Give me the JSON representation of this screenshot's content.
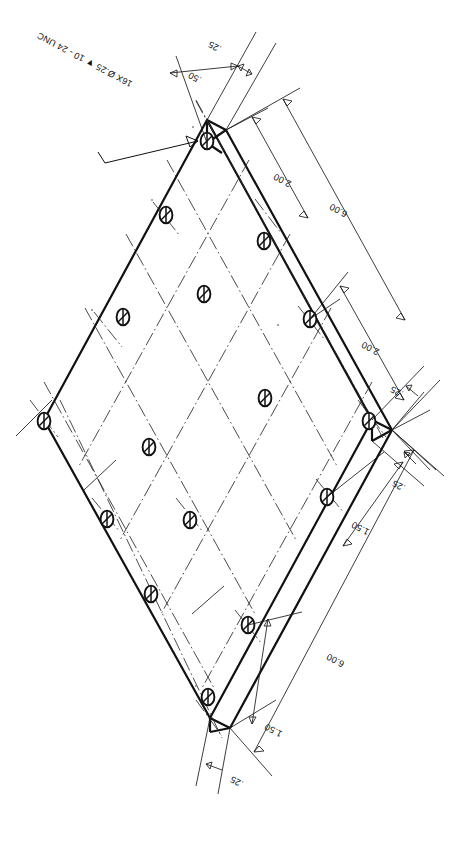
{
  "drawing": {
    "title": "Square plate — rotated plan view with tapped hole pattern",
    "view_rotation_deg": 180,
    "background_color": "#ffffff",
    "line_color": "#111111",
    "paper_size_px": [
      462,
      844
    ]
  },
  "note": {
    "id": "hole-callout",
    "text": "16X Ø.25 ▼ 10 - 24 UNC",
    "quantity_label": "16X",
    "diameter_label": "Ø.25",
    "depth_symbol": "▼",
    "thread_label": "10 - 24 UNC"
  },
  "dimensions": [
    {
      "id": "dim-top-025",
      "label": ".25",
      "value": 0.25,
      "units": "in",
      "location": "top-left-edge-offset"
    },
    {
      "id": "dim-top-050",
      "label": ".50",
      "value": 0.5,
      "units": "in",
      "location": "top-left-edge-offset"
    },
    {
      "id": "dim-upper-right-200",
      "label": "2.00",
      "value": 2.0,
      "units": "in",
      "location": "upper-right-pitch"
    },
    {
      "id": "dim-upper-right-600",
      "label": "6.00",
      "value": 6.0,
      "units": "in",
      "location": "upper-right-overall"
    },
    {
      "id": "dim-right-200",
      "label": "2.00",
      "value": 2.0,
      "units": "in",
      "location": "right-pitch"
    },
    {
      "id": "dim-right-025-upper",
      "label": ".25",
      "value": 0.25,
      "units": "in",
      "location": "right-vertex-upper"
    },
    {
      "id": "dim-right-025-lower",
      "label": ".25",
      "value": 0.25,
      "units": "in",
      "location": "right-vertex-lower"
    },
    {
      "id": "dim-right-150",
      "label": "1.50",
      "value": 1.5,
      "units": "in",
      "location": "lower-right-edge"
    },
    {
      "id": "dim-lower-right-600",
      "label": "6.00",
      "value": 6.0,
      "units": "in",
      "location": "lower-right-overall"
    },
    {
      "id": "dim-bottom-150",
      "label": "1.50",
      "value": 1.5,
      "units": "in",
      "location": "bottom-edge"
    },
    {
      "id": "dim-bottom-025",
      "label": ".25",
      "value": 0.25,
      "units": "in",
      "location": "bottom-vertex"
    }
  ],
  "hole_pattern": {
    "count": 16,
    "rows": 4,
    "cols": 4,
    "pitch": 2.0,
    "diameter": 0.25,
    "thread": "10 - 24 UNC"
  },
  "plate": {
    "width": 6.0,
    "height": 6.0,
    "edge_offset": 0.25,
    "thickness_offset": 0.25
  }
}
